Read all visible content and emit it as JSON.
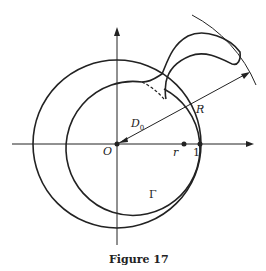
{
  "figure": {
    "caption": "Figure 17",
    "labels": {
      "origin": "O",
      "inner_radius": "r",
      "unit_point": "1",
      "domain": "D",
      "domain_sub": "0",
      "big_radius": "R",
      "curve": "Γ"
    },
    "colors": {
      "stroke": "#222222",
      "background": "#ffffff"
    }
  }
}
